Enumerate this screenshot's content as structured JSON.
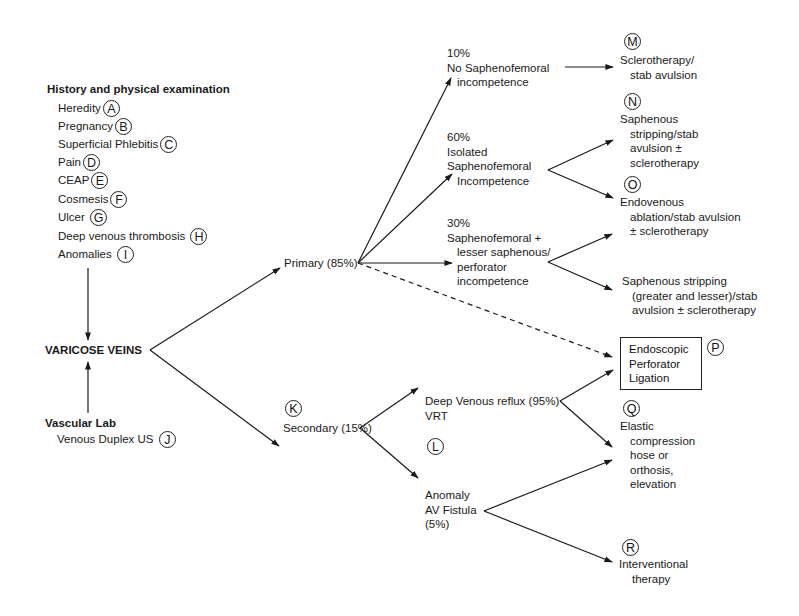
{
  "history": {
    "title": "History and physical examination",
    "items": [
      {
        "label": "Heredity",
        "marker": "A"
      },
      {
        "label": "Pregnancy",
        "marker": "B"
      },
      {
        "label": "Superficial Phlebitis",
        "marker": "C"
      },
      {
        "label": "Pain",
        "marker": "D"
      },
      {
        "label": "CEAP",
        "marker": "E"
      },
      {
        "label": "Cosmesis",
        "marker": "F"
      },
      {
        "label": "Ulcer",
        "marker": "G"
      },
      {
        "label": "Deep venous thrombosis",
        "marker": "H"
      },
      {
        "label": "Anomalies",
        "marker": "I"
      }
    ]
  },
  "center": {
    "label": "VARICOSE VEINS"
  },
  "vascular_lab": {
    "title": "Vascular Lab",
    "item": "Venous Duplex US",
    "marker": "J"
  },
  "primary": {
    "label": "Primary (85%)"
  },
  "secondary": {
    "label": "Secondary (15%)",
    "marker": "K"
  },
  "primary_branches": [
    {
      "pct": "10%",
      "lines": [
        "No Saphenofemoral",
        "incompetence"
      ]
    },
    {
      "pct": "60%",
      "lines": [
        "Isolated",
        "Saphenofemoral",
        "Incompetence"
      ]
    },
    {
      "pct": "30%",
      "lines": [
        "Saphenofemoral +",
        "lesser saphenous/",
        "perforator",
        "incompetence"
      ]
    }
  ],
  "treatments": {
    "M": {
      "marker": "M",
      "lines": [
        "Sclerotherapy/",
        "stab avulsion"
      ]
    },
    "N": {
      "marker": "N",
      "lines": [
        "Saphenous",
        "stripping/stab",
        "avulsion ±",
        "sclerotherapy"
      ]
    },
    "O": {
      "marker": "O",
      "lines": [
        "Endovenous",
        "ablation/stab avulsion",
        "± sclerotherapy"
      ]
    },
    "S": {
      "lines": [
        "Saphenous stripping",
        "(greater and lesser)/stab",
        "avulsion ± sclerotherapy"
      ]
    },
    "P": {
      "marker": "P",
      "lines": [
        "Endoscopic",
        "Perforator",
        "Ligation"
      ]
    },
    "Q": {
      "marker": "Q",
      "lines": [
        "Elastic",
        "compression",
        "hose or",
        "orthosis,",
        "elevation"
      ]
    },
    "R": {
      "marker": "R",
      "lines": [
        "Interventional",
        "therapy"
      ]
    }
  },
  "secondary_branches": {
    "deep": {
      "lines": [
        "Deep Venous reflux (95%)",
        "VRT"
      ],
      "marker": "L"
    },
    "anomaly": {
      "lines": [
        "Anomaly",
        "AV Fistula",
        "(5%)"
      ]
    }
  },
  "colors": {
    "ink": "#1a1a1a",
    "background": "#ffffff"
  }
}
